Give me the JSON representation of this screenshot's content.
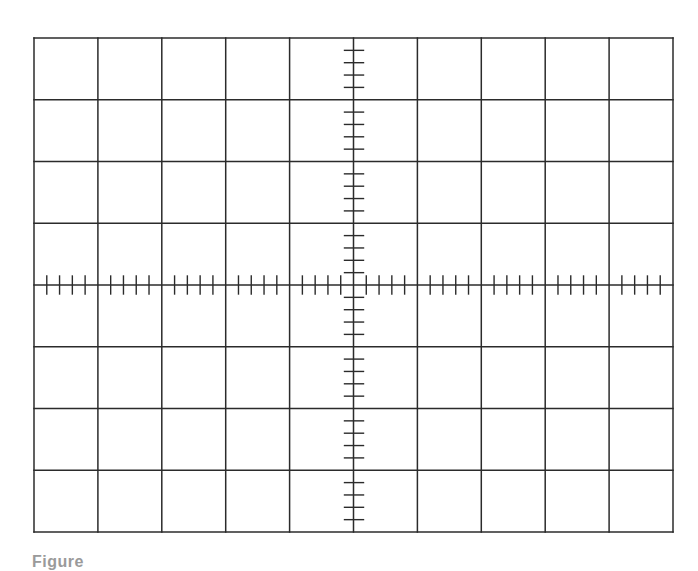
{
  "figure": {
    "type": "oscilloscope-graticule",
    "caption": "Figure",
    "colors": {
      "background": "#ffffff",
      "line": "#2b2b2b"
    },
    "grid": {
      "left": 34,
      "top": 38,
      "width": 639,
      "height": 494,
      "columns": 10,
      "rows": 8,
      "line_width": 1.5
    },
    "axes": {
      "center_x_division": 5,
      "center_y_division": 4,
      "minor_ticks_per_division": 5,
      "horizontal_tick_half_length": 9,
      "vertical_tick_left": 9,
      "vertical_tick_right": 10
    }
  }
}
